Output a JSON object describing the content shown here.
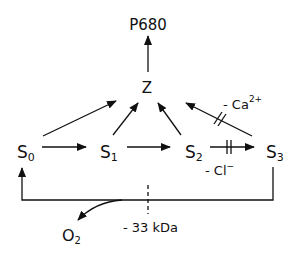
{
  "diagram": {
    "type": "reaction-scheme",
    "nodes": {
      "p680": {
        "label": "P680"
      },
      "z": {
        "label": "Z"
      },
      "s0": {
        "base": "S",
        "sub": "0"
      },
      "s1": {
        "base": "S",
        "sub": "1"
      },
      "s2": {
        "base": "S",
        "sub": "2"
      },
      "s3": {
        "base": "S",
        "sub": "3"
      },
      "o2": {
        "base": "O",
        "sub": "2"
      }
    },
    "annotations": {
      "calcium": {
        "prefix": "- Ca",
        "sup": "2+"
      },
      "chloride": {
        "prefix": "- Cl",
        "sup": "−"
      },
      "kda": {
        "label": "- 33 kDa"
      }
    },
    "edges": [
      {
        "from": "Z",
        "to": "P680"
      },
      {
        "from": "S0",
        "to": "Z"
      },
      {
        "from": "S1",
        "to": "Z"
      },
      {
        "from": "S2",
        "to": "Z"
      },
      {
        "from": "S3",
        "to": "Z",
        "blocked_by": "- Ca2+"
      },
      {
        "from": "S0",
        "to": "S1"
      },
      {
        "from": "S1",
        "to": "S2"
      },
      {
        "from": "S2",
        "to": "S3",
        "blocked_by": "- Cl-"
      },
      {
        "from": "S3",
        "to": "S0",
        "releases": "O2",
        "blocked_by": "- 33 kDa"
      }
    ],
    "colors": {
      "ink": "#111111",
      "background": "#ffffff"
    }
  }
}
